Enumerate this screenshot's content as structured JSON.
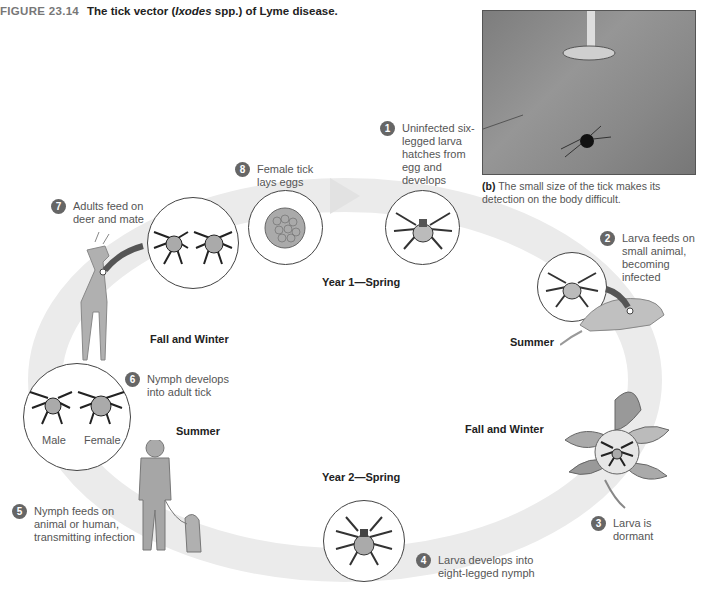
{
  "figure": {
    "number": "FIGURE 23.14",
    "title_prefix": "The tick vector (",
    "title_italic": "Ixodes",
    "title_suffix": " spp.) of Lyme disease."
  },
  "photo": {
    "caption_label": "(b)",
    "caption_text": " The small size of the tick makes its detection on the body difficult."
  },
  "seasons": {
    "year1_spring": "Year 1—Spring",
    "summer_right": "Summer",
    "fall_winter_right": "Fall and Winter",
    "year2_spring": "Year 2—Spring",
    "summer_left": "Summer",
    "fall_winter_left": "Fall and Winter"
  },
  "steps": [
    {
      "num": "1",
      "text": "Uninfected six-legged larva hatches from egg and develops"
    },
    {
      "num": "2",
      "text": "Larva feeds on small animal, becoming infected"
    },
    {
      "num": "3",
      "text": "Larva is dormant"
    },
    {
      "num": "4",
      "text": "Larva develops into eight-legged nymph"
    },
    {
      "num": "5",
      "text": "Nymph feeds on animal or human, transmitting infection"
    },
    {
      "num": "6",
      "text": "Nymph develops into adult tick"
    },
    {
      "num": "7",
      "text": "Adults feed on deer and mate"
    },
    {
      "num": "8",
      "text": "Female tick lays eggs"
    }
  ],
  "adult_labels": {
    "male": "Male",
    "female": "Female"
  },
  "colors": {
    "badge": "#666666",
    "cycle_band": "#e8e8e8",
    "animal": "#a8a8a8"
  }
}
